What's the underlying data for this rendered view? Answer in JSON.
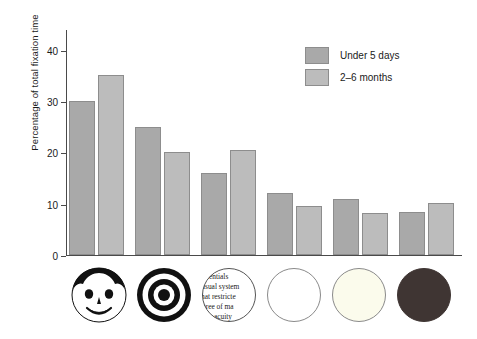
{
  "chart_data": {
    "type": "bar",
    "title": "",
    "subtitle": "",
    "xlabel": "",
    "ylabel": "Percentage of total fixation time",
    "ylim": [
      0,
      44
    ],
    "yticks": [
      0,
      10,
      20,
      30,
      40
    ],
    "ytick_labels": [
      "0",
      "10",
      "20",
      "30",
      "40"
    ],
    "grid": false,
    "legend_position": "top-right",
    "categories": [
      "face",
      "bullseye",
      "newsprint",
      "white",
      "yellow",
      "red"
    ],
    "category_labels": [
      "Face",
      "Bullseye",
      "Newsprint",
      "White",
      "Yellow",
      "Red"
    ],
    "series": [
      {
        "name": "Under 5 days",
        "color": "#a9a9a9",
        "values": [
          30,
          25,
          16,
          12,
          11,
          8.3
        ]
      },
      {
        "name": "2–6 months",
        "color": "#bcbcbc",
        "values": [
          35,
          20,
          20.5,
          9.5,
          8.2,
          10.2
        ]
      }
    ]
  },
  "legend": {
    "items": [
      {
        "label": "Under 5 days",
        "color": "#a9a9a9"
      },
      {
        "label": "2–6 months",
        "color": "#bcbcbc"
      }
    ]
  },
  "axis": {
    "y_title": "Percentage of total fixation time",
    "y_tick_labels": [
      "0",
      "10",
      "20",
      "30",
      "40"
    ]
  },
  "stimuli": [
    {
      "name": "face-stimulus-icon",
      "label": "Face"
    },
    {
      "name": "bullseye-stimulus-icon",
      "label": "Bullseye"
    },
    {
      "name": "newsprint-stimulus-icon",
      "label": "Newsprint",
      "text_lines": [
        "entials",
        "isual system",
        "hat restricte",
        "gree of ma",
        "acuity"
      ]
    },
    {
      "name": "white-circle-stimulus-icon",
      "label": "White"
    },
    {
      "name": "yellow-circle-stimulus-icon",
      "label": "Yellow"
    },
    {
      "name": "red-circle-stimulus-icon",
      "label": "Red"
    }
  ]
}
